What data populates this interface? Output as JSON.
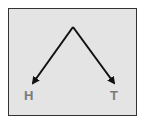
{
  "diagram": {
    "type": "tree",
    "root": {
      "x": 73,
      "y": 27
    },
    "branches": [
      {
        "label": "H",
        "tip": {
          "x": 31,
          "y": 85
        }
      },
      {
        "label": "T",
        "tip": {
          "x": 116,
          "y": 85
        }
      }
    ],
    "colors": {
      "background": "#e4e4e4",
      "border": "#333333",
      "arrow": "#111111",
      "label": "#7a7a7a"
    }
  }
}
